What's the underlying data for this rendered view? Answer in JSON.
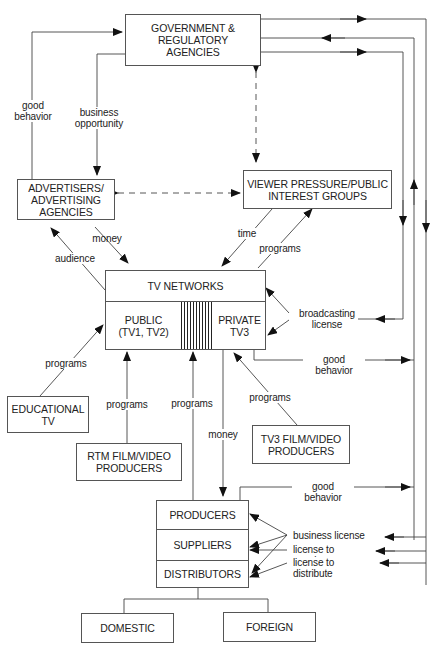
{
  "nodes": {
    "government": "GOVERNMENT &\nREGULATORY\nAGENCIES",
    "advertisers": "ADVERTISERS/\nADVERTISING\nAGENCIES",
    "viewer_groups": "VIEWER PRESSURE/PUBLIC\nINTEREST GROUPS",
    "tv_networks": {
      "title": "TV NETWORKS",
      "public": "PUBLIC\n(TV1, TV2)",
      "private": "PRIVATE\nTV3"
    },
    "educational_tv": "EDUCATIONAL\nTV",
    "rtm_producers": "RTM FILM/VIDEO\nPRODUCERS",
    "tv3_producers": "TV3 FILM/VIDEO\nPRODUCERS",
    "industry": {
      "producers": "PRODUCERS",
      "suppliers": "SUPPLIERS",
      "distributors": "DISTRIBUTORS"
    },
    "domestic": "DOMESTIC",
    "foreign": "FOREIGN"
  },
  "edges": {
    "good_behavior_adv": "good\nbehavior",
    "business_opportunity": "business\nopportunity",
    "money_adv": "money",
    "audience": "audience",
    "time": "time",
    "programs_viewer": "programs",
    "broadcasting_license": "broadcasting\nlicense",
    "good_behavior_tv": "good behavior",
    "programs_edu": "programs",
    "programs_rtm": "programs",
    "programs_main": "programs",
    "money_producers": "money",
    "programs_tv3": "programs",
    "good_behavior_producers": "good behavior",
    "business_license": "business license",
    "license_to_supply": "license to supply",
    "license_to_distribute": "license to distribute"
  },
  "colors": {
    "line": "#444444",
    "box_border": "#555555",
    "text": "#222222"
  }
}
